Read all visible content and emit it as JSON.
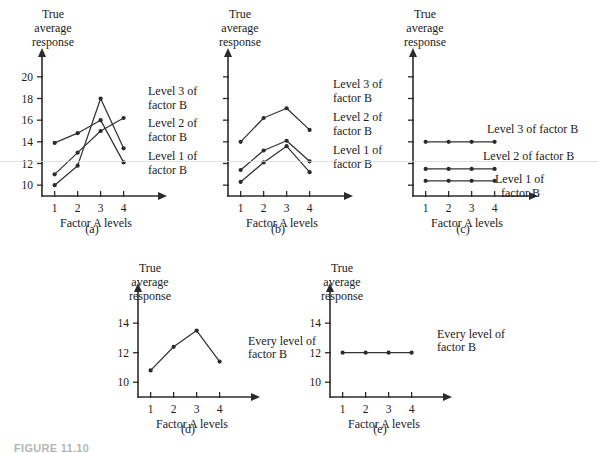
{
  "figure": {
    "caption_partial": "FIGURE 11.10",
    "axis_titles": {
      "y_line1": "True",
      "y_line2": "average",
      "y_line3": "response",
      "x": "Factor A levels"
    },
    "x_tick_labels": [
      "1",
      "2",
      "3",
      "4"
    ]
  },
  "chart_data": [
    {
      "id": "a",
      "type": "line",
      "panel_label": "(a)",
      "title": "",
      "xlabel": "Factor A levels",
      "ylabel": "True average response",
      "categories": [
        "1",
        "2",
        "3",
        "4"
      ],
      "x": [
        1,
        2,
        3,
        4
      ],
      "ylim": [
        9,
        21
      ],
      "xlim": [
        0.45,
        4.8
      ],
      "yticks": [
        10,
        12,
        14,
        16,
        18,
        20
      ],
      "ytick_labels": [
        "10",
        "12",
        "14",
        "16",
        "18",
        "20"
      ],
      "grid": false,
      "legend_position": "right-inline",
      "series": [
        {
          "name": "Level 3 of factor B",
          "values": [
            10.0,
            11.8,
            18.0,
            13.4
          ]
        },
        {
          "name": "Level 2 of factor B",
          "values": [
            11.0,
            13.0,
            15.0,
            16.2
          ]
        },
        {
          "name": "Level 1 of factor B",
          "values": [
            13.9,
            14.8,
            16.0,
            12.1
          ]
        }
      ],
      "annotations": [
        {
          "text_line1": "Level 3 of",
          "text_line2": "factor B"
        },
        {
          "text_line1": "Level 2 of",
          "text_line2": "factor B"
        },
        {
          "text_line1": "Level 1 of",
          "text_line2": "factor B"
        }
      ]
    },
    {
      "id": "b",
      "type": "line",
      "panel_label": "(b)",
      "title": "",
      "xlabel": "Factor A levels",
      "ylabel": "True average response",
      "categories": [
        "1",
        "2",
        "3",
        "4"
      ],
      "x": [
        1,
        2,
        3,
        4
      ],
      "ylim": [
        9,
        21
      ],
      "xlim": [
        0.45,
        4.8
      ],
      "yticks": [
        10,
        12,
        14,
        16,
        18,
        20
      ],
      "ytick_labels": [
        "",
        "",
        "",
        "",
        "",
        ""
      ],
      "grid": false,
      "legend_position": "right-inline",
      "series": [
        {
          "name": "Level 3 of factor B",
          "values": [
            14.0,
            16.2,
            17.1,
            15.1
          ]
        },
        {
          "name": "Level 2 of factor B",
          "values": [
            11.4,
            13.2,
            14.1,
            12.2
          ]
        },
        {
          "name": "Level 1 of factor B",
          "values": [
            10.3,
            12.1,
            13.6,
            11.2
          ]
        }
      ],
      "annotations": [
        {
          "text_line1": "Level 3 of",
          "text_line2": "factor B"
        },
        {
          "text_line1": "Level 2 of",
          "text_line2": "factor B"
        },
        {
          "text_line1": "Level 1 of",
          "text_line2": "factor B"
        }
      ]
    },
    {
      "id": "c",
      "type": "line",
      "panel_label": "(c)",
      "title": "",
      "xlabel": "Factor A levels",
      "ylabel": "True average response",
      "categories": [
        "1",
        "2",
        "3",
        "4"
      ],
      "x": [
        1,
        2,
        3,
        4
      ],
      "ylim": [
        9,
        21
      ],
      "xlim": [
        0.45,
        4.8
      ],
      "yticks": [
        10,
        12,
        14,
        16,
        18,
        20
      ],
      "ytick_labels": [
        "",
        "",
        "",
        "",
        "",
        ""
      ],
      "grid": false,
      "legend_position": "right-inline",
      "series": [
        {
          "name": "Level 3 of factor B",
          "values": [
            14.0,
            14.0,
            14.0,
            14.0
          ]
        },
        {
          "name": "Level 2 of factor B",
          "values": [
            11.5,
            11.5,
            11.5,
            11.5
          ]
        },
        {
          "name": "Level 1 of factor B",
          "values": [
            10.4,
            10.4,
            10.4,
            10.4
          ]
        }
      ],
      "annotations": [
        {
          "text_line1": "Level 3 of factor B",
          "text_line2": ""
        },
        {
          "text_line1": "Level 2 of factor B",
          "text_line2": ""
        },
        {
          "text_line1": "Level 1 of",
          "text_line2": "factor B"
        }
      ]
    },
    {
      "id": "d",
      "type": "line",
      "panel_label": "(d)",
      "title": "",
      "xlabel": "Factor A levels",
      "ylabel": "True average response",
      "categories": [
        "1",
        "2",
        "3",
        "4"
      ],
      "x": [
        1,
        2,
        3,
        4
      ],
      "ylim": [
        9,
        15.5
      ],
      "xlim": [
        0.45,
        4.8
      ],
      "yticks": [
        10,
        12,
        14
      ],
      "ytick_labels": [
        "10",
        "12",
        "14"
      ],
      "grid": false,
      "legend_position": "right-inline",
      "series": [
        {
          "name": "Every level of factor B",
          "values": [
            10.8,
            12.4,
            13.5,
            11.4
          ]
        }
      ],
      "annotations": [
        {
          "text_line1": "Every level  of",
          "text_line2": "factor B"
        }
      ]
    },
    {
      "id": "e",
      "type": "line",
      "panel_label": "(e)",
      "title": "",
      "xlabel": "Factor A levels",
      "ylabel": "True average response",
      "categories": [
        "1",
        "2",
        "3",
        "4"
      ],
      "x": [
        1,
        2,
        3,
        4
      ],
      "ylim": [
        9,
        15.5
      ],
      "xlim": [
        0.45,
        4.8
      ],
      "yticks": [
        10,
        12,
        14
      ],
      "ytick_labels": [
        "10",
        "12",
        "14"
      ],
      "grid": false,
      "legend_position": "right-inline",
      "series": [
        {
          "name": "Every level of factor B",
          "values": [
            12.0,
            12.0,
            12.0,
            12.0
          ]
        }
      ],
      "annotations": [
        {
          "text_line1": "Every level  of",
          "text_line2": "factor B"
        }
      ]
    }
  ]
}
